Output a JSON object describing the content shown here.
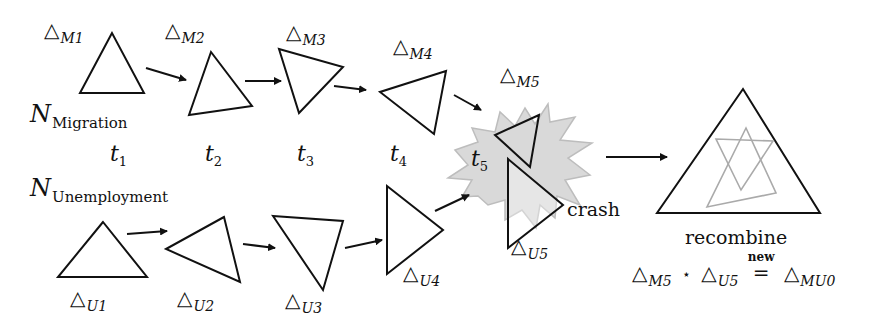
{
  "networks": {
    "migration": {
      "symbol": "N",
      "subscript": "Migration"
    },
    "unemployment": {
      "symbol": "N",
      "subscript": "Unemployment"
    }
  },
  "times": [
    {
      "symbol": "t",
      "sub": "1"
    },
    {
      "symbol": "t",
      "sub": "2"
    },
    {
      "symbol": "t",
      "sub": "3"
    },
    {
      "symbol": "t",
      "sub": "4"
    },
    {
      "symbol": "t",
      "sub": "5"
    }
  ],
  "migration_triangles": [
    {
      "symbol": "△",
      "sub": "M1"
    },
    {
      "symbol": "△",
      "sub": "M2"
    },
    {
      "symbol": "△",
      "sub": "M3"
    },
    {
      "symbol": "△",
      "sub": "M4"
    },
    {
      "symbol": "△",
      "sub": "M5"
    }
  ],
  "unemployment_triangles": [
    {
      "symbol": "△",
      "sub": "U1"
    },
    {
      "symbol": "△",
      "sub": "U2"
    },
    {
      "symbol": "△",
      "sub": "U3"
    },
    {
      "symbol": "△",
      "sub": "U4"
    },
    {
      "symbol": "△",
      "sub": "U5"
    }
  ],
  "events": {
    "crash": "crash",
    "recombine": "recombine"
  },
  "equation": {
    "left_symbol": "△",
    "left_sub": "M5",
    "operator": "⋆",
    "right_symbol": "△",
    "right_sub": "U5",
    "relation_label": "new",
    "relation": "=",
    "result_symbol": "△",
    "result_sub": "MU0"
  },
  "colors": {
    "stroke": "#111111",
    "burst_fill": "#d9d9d9",
    "burst_stroke": "#bdbdbd",
    "ghost_stroke": "#aaaaaa"
  }
}
